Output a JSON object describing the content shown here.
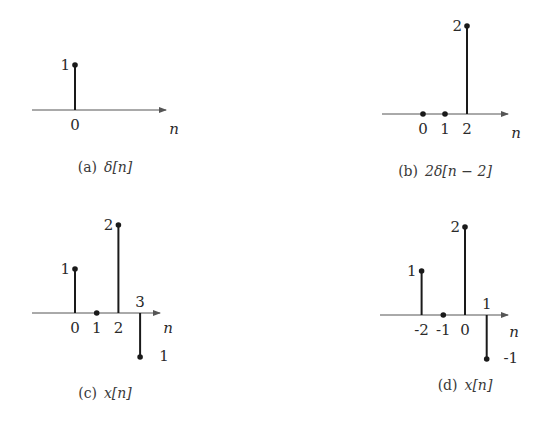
{
  "chart_data": [
    {
      "type": "stem",
      "panel": "a",
      "caption_tag": "(a)",
      "caption_expr": "δ[n]",
      "xlabel": "n",
      "origin": [
        75,
        110
      ],
      "axis_x": [
        32,
        166
      ],
      "unit_x": 21.5,
      "unit_y": 45,
      "points": [
        {
          "n": 0,
          "value": 1,
          "n_label": "0",
          "v_label": "1"
        }
      ],
      "zero_dots": [],
      "n_label_pos": [
        174,
        134
      ],
      "caption_pos": [
        105,
        172
      ]
    },
    {
      "type": "stem",
      "panel": "b",
      "caption_tag": "(b)",
      "caption_expr": "2δ[n − 2]",
      "xlabel": "n",
      "origin": [
        423,
        114
      ],
      "axis_x": [
        382,
        508
      ],
      "unit_x": 22,
      "unit_y": 44,
      "points": [
        {
          "n": 2,
          "value": 2,
          "n_label": "2",
          "v_label": "2"
        }
      ],
      "zero_dots": [
        {
          "n": 0,
          "n_label": "0"
        },
        {
          "n": 1,
          "n_label": "1"
        }
      ],
      "n_label_pos": [
        516,
        138
      ],
      "caption_pos": [
        445,
        176
      ]
    },
    {
      "type": "stem",
      "panel": "c",
      "caption_tag": "(c)",
      "caption_expr": "x[n]",
      "xlabel": "n",
      "origin": [
        75,
        313
      ],
      "axis_x": [
        32,
        160
      ],
      "unit_x": 21.7,
      "unit_y": 44,
      "points": [
        {
          "n": 0,
          "value": 1,
          "n_label": "0",
          "v_label": "1"
        },
        {
          "n": 2,
          "value": 2,
          "n_label": "2",
          "v_label": "2"
        },
        {
          "n": 3,
          "value": -1,
          "n_label": "3",
          "v_label": "1"
        }
      ],
      "zero_dots": [
        {
          "n": 1,
          "n_label": "1"
        }
      ],
      "n_label_pos": [
        168,
        333
      ],
      "caption_pos": [
        105,
        398
      ]
    },
    {
      "type": "stem",
      "panel": "d",
      "caption_tag": "(d)",
      "caption_expr": "x[n]",
      "xlabel": "n",
      "origin": [
        465,
        315
      ],
      "axis_x": [
        380,
        508
      ],
      "unit_x": 21.7,
      "unit_y": 44,
      "points": [
        {
          "n": -2,
          "value": 1,
          "n_label": "-2",
          "v_label": "1"
        },
        {
          "n": 0,
          "value": 2,
          "n_label": "0",
          "v_label": "2"
        },
        {
          "n": 1,
          "value": -1,
          "n_label": "1",
          "v_label": "-1"
        }
      ],
      "zero_dots": [
        {
          "n": -1,
          "n_label": "-1"
        }
      ],
      "n_label_pos": [
        514,
        337
      ],
      "caption_pos": [
        465,
        390
      ]
    }
  ],
  "colors": {
    "ink": "#1a1a1a",
    "axis": "#555555",
    "text": "#2a2a2a"
  }
}
